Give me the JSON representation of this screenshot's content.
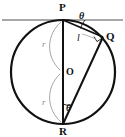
{
  "figure": {
    "type": "geometry-diagram",
    "canvas": {
      "width": 125,
      "height": 137,
      "background": "#ffffff"
    },
    "colors": {
      "stroke": "#111111",
      "tangent": "#8a8a8a",
      "helper_arc": "#9a9a9a",
      "label": "#111111",
      "label_muted": "#8a8a8a"
    },
    "circle": {
      "cx": 63,
      "cy": 72,
      "r": 52,
      "stroke_width": 2.2
    },
    "points": [
      {
        "id": "P",
        "label": "P",
        "x": 63,
        "y": 20,
        "label_x": 59,
        "label_y": 2
      },
      {
        "id": "Q",
        "label": "Q",
        "x": 103,
        "y": 37,
        "label_x": 106,
        "label_y": 31
      },
      {
        "id": "R",
        "label": "R",
        "x": 63,
        "y": 124,
        "label_x": 59,
        "label_y": 126
      },
      {
        "id": "O",
        "label": "O",
        "x": 63,
        "y": 72,
        "label_x": 66,
        "label_y": 67
      }
    ],
    "tangent_line": {
      "x1": 2,
      "y1": 20,
      "x2": 123,
      "y2": 20,
      "stroke_width": 1.6
    },
    "segments": [
      {
        "id": "PR",
        "from": "P",
        "to": "R",
        "stroke_width": 2.0
      },
      {
        "id": "PQ",
        "from": "P",
        "to": "Q",
        "stroke_width": 1.8
      },
      {
        "id": "QR",
        "from": "Q",
        "to": "R",
        "stroke_width": 2.0
      }
    ],
    "length_labels": [
      {
        "id": "l",
        "text": "l",
        "for_segment": "PQ",
        "x": 77,
        "y": 33
      }
    ],
    "radius_labels": [
      {
        "id": "r-upper",
        "text": "r",
        "x": 42,
        "y": 40
      },
      {
        "id": "r-lower",
        "text": "r",
        "x": 42,
        "y": 98
      }
    ],
    "helper_arcs": [
      {
        "id": "radius-arc-upper",
        "path": "M 61 22 C 47 34, 45 56, 60 70",
        "stroke_width": 0.9
      },
      {
        "id": "radius-arc-lower",
        "path": "M 60 74 C 45 88, 47 110, 61 122",
        "stroke_width": 0.9
      }
    ],
    "angle_marks": [
      {
        "id": "angle-theta-at-P",
        "text": "θ",
        "vertex": "P",
        "label_x": 79,
        "label_y": 11,
        "arc_path": "M 85 20 A 22 22 0 0 0 80.5 28.5",
        "stroke_width": 0.9
      },
      {
        "id": "angle-theta-at-R",
        "text": "θ",
        "vertex": "R",
        "label_x": 66,
        "label_y": 103,
        "arc_path": "M 63 104 A 20 20 0 0 0 70.5 105.5",
        "stroke_width": 0.9
      }
    ],
    "right_angle": {
      "id": "right-angle-at-Q",
      "vertex": "Q",
      "marker": "square",
      "path": "M 94.0 36.5 L 97.0 41.6 L 101.6 38.5",
      "stroke_width": 0.9
    },
    "alt_notation": {
      "theta": "θ",
      "length": "l",
      "radius": "r"
    }
  }
}
